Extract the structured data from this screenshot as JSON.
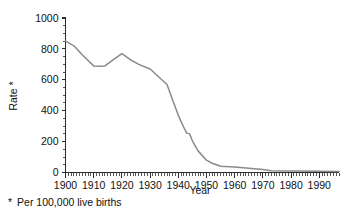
{
  "chart_data": {
    "type": "line",
    "title": "",
    "subtitle": "",
    "xlabel": "Year",
    "ylabel": "Rate *",
    "xlim": [
      1900,
      1997
    ],
    "ylim": [
      0,
      1000
    ],
    "grid": false,
    "legend": null,
    "x_ticks": [
      1900,
      1910,
      1920,
      1930,
      1940,
      1950,
      1960,
      1970,
      1980,
      1990
    ],
    "x_tick_labels": [
      "1900",
      "1910",
      "1920",
      "1930",
      "1940",
      "1950",
      "1960",
      "1970",
      "1980",
      "1990"
    ],
    "x_minor_tick_interval": 1,
    "y_ticks": [
      0,
      200,
      400,
      600,
      800,
      1000
    ],
    "y_tick_labels": [
      "0",
      "200",
      "400",
      "600",
      "800",
      "1000"
    ],
    "y_minor_tick_interval": 50,
    "line_color": "#8a8a8a",
    "axis_color": "#2b2b2b",
    "series": [
      {
        "name": "Maternal mortality rate",
        "x": [
          1900,
          1903,
          1906,
          1910,
          1912,
          1914,
          1917,
          1920,
          1923,
          1926,
          1930,
          1933,
          1936,
          1938,
          1940,
          1942,
          1943,
          1944,
          1945,
          1947,
          1950,
          1952,
          1955,
          1960,
          1965,
          1970,
          1973,
          1980,
          1990,
          1997
        ],
        "values": [
          850,
          820,
          760,
          690,
          688,
          690,
          730,
          770,
          730,
          700,
          670,
          620,
          570,
          470,
          370,
          290,
          255,
          250,
          205,
          140,
          80,
          60,
          40,
          35,
          28,
          20,
          12,
          10,
          8,
          7
        ]
      }
    ],
    "annotations": [
      {
        "text": "* Per 100,000 live births"
      }
    ]
  },
  "footnote": {
    "star": "*",
    "text": "Per 100,000 live births"
  }
}
